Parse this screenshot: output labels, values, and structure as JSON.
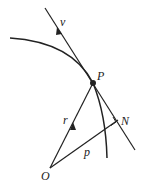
{
  "diagram": {
    "labels": {
      "velocity": "v",
      "point": "P",
      "radius": "r",
      "perpendicular": "p",
      "foot": "N",
      "origin": "O"
    },
    "colors": {
      "stroke": "#222222",
      "background": "#ffffff"
    }
  }
}
